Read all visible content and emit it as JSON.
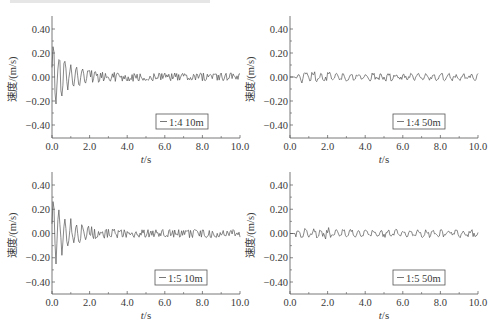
{
  "chart_data": [
    {
      "type": "line",
      "panel": "top-left",
      "title": "",
      "xlabel": "t/s",
      "ylabel": "速度/(m/s)",
      "xlim": [
        0,
        10
      ],
      "ylim": [
        -0.5,
        0.5
      ],
      "xticks": [
        "0.0",
        "2.0",
        "4.0",
        "6.0",
        "8.0",
        "10.0"
      ],
      "yticks": [
        "0.40",
        "0.20",
        "0.00",
        "-0.20",
        "-0.40"
      ],
      "legend": "1:4 10m",
      "legend_position": "lower right",
      "grid": false,
      "series": [
        {
          "name": "1:4 10m",
          "description": "damped oscillation, peak ≈ +0.24 / -0.26 near t≈0.2–0.4 s, decaying to ±0.03 by t≈4 s"
        }
      ]
    },
    {
      "type": "line",
      "panel": "top-right",
      "title": "",
      "xlabel": "t/s",
      "ylabel": "速度/(m/s)",
      "xlim": [
        0,
        10
      ],
      "ylim": [
        -0.5,
        0.5
      ],
      "xticks": [
        "0.0",
        "2.0",
        "4.0",
        "6.0",
        "8.0",
        "10.0"
      ],
      "yticks": [
        "0.40",
        "0.20",
        "0.00",
        "-0.20",
        "-0.40"
      ],
      "legend": "1:4 50m",
      "legend_position": "lower right",
      "grid": false,
      "series": [
        {
          "name": "1:4 50m",
          "description": "small oscillation around 0, amplitude ≈ ±0.04 over 0.3–10 s"
        }
      ]
    },
    {
      "type": "line",
      "panel": "bottom-left",
      "title": "",
      "xlabel": "t/s",
      "ylabel": "速度/(m/s)",
      "xlim": [
        0,
        10
      ],
      "ylim": [
        -0.5,
        0.5
      ],
      "xticks": [
        "0.0",
        "2.0",
        "4.0",
        "6.0",
        "8.0",
        "10.0"
      ],
      "yticks": [
        "0.40",
        "0.20",
        "0.00",
        "-0.20",
        "-0.40"
      ],
      "legend": "1:5 10m",
      "legend_position": "lower right",
      "grid": false,
      "series": [
        {
          "name": "1:5 10m",
          "description": "damped oscillation, peak ≈ +0.27 / -0.28 near t≈0.2–0.5 s, decaying to ±0.03 by t≈4 s"
        }
      ]
    },
    {
      "type": "line",
      "panel": "bottom-right",
      "title": "",
      "xlabel": "t/s",
      "ylabel": "速度/(m/s)",
      "xlim": [
        0,
        10
      ],
      "ylim": [
        -0.5,
        0.5
      ],
      "xticks": [
        "0.0",
        "2.0",
        "4.0",
        "6.0",
        "8.0",
        "10.0"
      ],
      "yticks": [
        "0.40",
        "0.20",
        "0.00",
        "-0.20",
        "-0.40"
      ],
      "legend": "1:5 50m",
      "legend_position": "lower right",
      "grid": false,
      "series": [
        {
          "name": "1:5 50m",
          "description": "small oscillation around 0, amplitude ≈ ±0.04 over 0.3–10 s"
        }
      ]
    }
  ],
  "panels": [
    {
      "legend": "1:4 10m",
      "ylabel": "速度/(m/s)",
      "xlabel_italic": "t",
      "xlabel_unit": "/s"
    },
    {
      "legend": "1:4 50m",
      "ylabel": "速度/(m/s)",
      "xlabel_italic": "t",
      "xlabel_unit": "/s"
    },
    {
      "legend": "1:5 10m",
      "ylabel": "速度/(m/s)",
      "xlabel_italic": "t",
      "xlabel_unit": "/s"
    },
    {
      "legend": "1:5 50m",
      "ylabel": "速度/(m/s)",
      "xlabel_italic": "t",
      "xlabel_unit": "/s"
    }
  ],
  "ticks": {
    "x": [
      "0.0",
      "2.0",
      "4.0",
      "6.0",
      "8.0",
      "10.0"
    ],
    "y": [
      "0.40",
      "0.20",
      "0.00",
      "-0.20",
      "-0.40"
    ]
  },
  "colors": {
    "line": "#555555",
    "axis": "#555555",
    "text": "#3a3a3a"
  }
}
